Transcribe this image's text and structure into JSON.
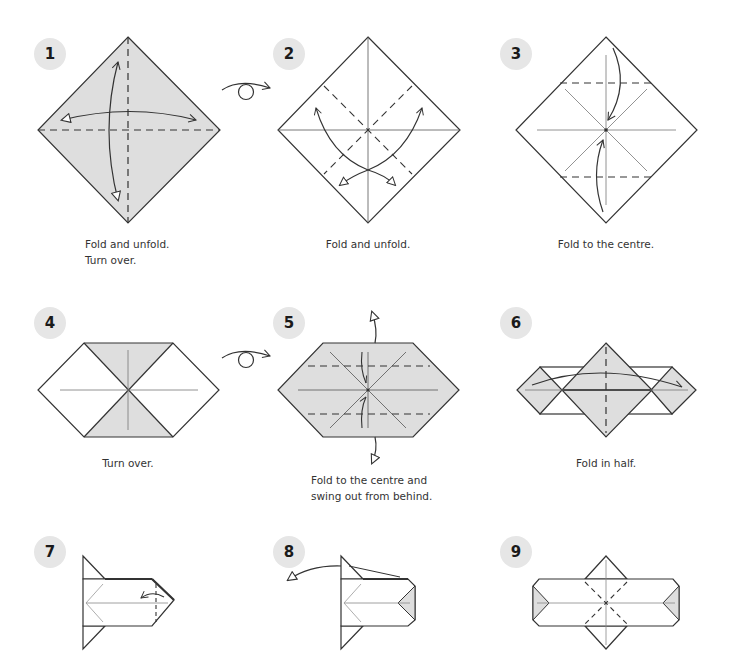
{
  "colors": {
    "paper_shaded": "#dedede",
    "paper_white": "#ffffff",
    "line": "#333333",
    "badge_bg": "#e6e6e6",
    "badge_text": "#1a1a1a",
    "caption_text": "#333333"
  },
  "steps": [
    {
      "number": "1",
      "caption_lines": [
        "Fold and unfold.",
        "Turn over."
      ]
    },
    {
      "number": "2",
      "caption_lines": [
        "Fold and unfold."
      ]
    },
    {
      "number": "3",
      "caption_lines": [
        "Fold to the centre."
      ]
    },
    {
      "number": "4",
      "caption_lines": [
        "Turn over."
      ]
    },
    {
      "number": "5",
      "caption_lines": [
        "Fold to the centre and",
        "swing out from behind."
      ]
    },
    {
      "number": "6",
      "caption_lines": [
        "Fold in half."
      ]
    },
    {
      "number": "7",
      "caption_lines": []
    },
    {
      "number": "8",
      "caption_lines": []
    },
    {
      "number": "9",
      "caption_lines": []
    }
  ],
  "symbols": {
    "turn_over_1_2": "turn-over-arrow",
    "turn_over_4_5": "turn-over-arrow"
  }
}
